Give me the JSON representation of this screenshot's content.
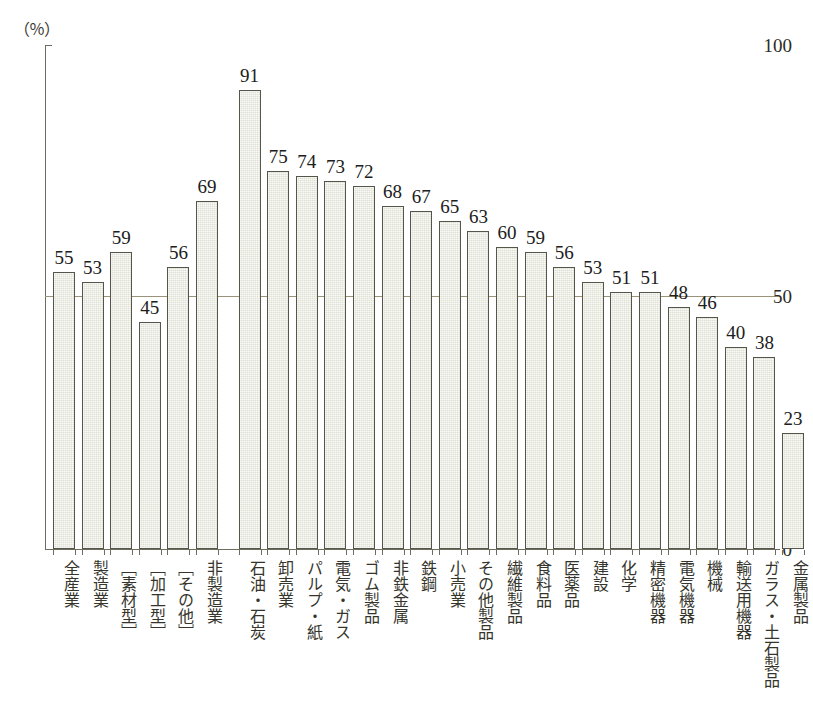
{
  "top_strip_text": "",
  "axis": {
    "y_unit": "（％）",
    "y_ticks": [
      "100",
      "50",
      "0"
    ]
  },
  "chart_data": {
    "type": "bar",
    "title": "",
    "xlabel": "",
    "ylabel": "（％）",
    "ylim": [
      0,
      100
    ],
    "grid": true,
    "gridlines": [
      50
    ],
    "legend": "none",
    "categories": [
      "全産業",
      "製造業",
      "［素材型］",
      "［加工型］",
      "［その他］",
      "非製造業",
      "石油・石炭",
      "卸売業",
      "パルプ・紙",
      "電気・ガス",
      "ゴム製品",
      "非鉄金属",
      "鉄鋼",
      "小売業",
      "その他製品",
      "繊維製品",
      "食料品",
      "医薬品",
      "建設",
      "化学",
      "精密機器",
      "電気機器",
      "機械",
      "輸送用機器",
      "ガラス・土石製品",
      "金属製品"
    ],
    "values": [
      55,
      53,
      59,
      45,
      56,
      69,
      91,
      75,
      74,
      73,
      72,
      68,
      67,
      65,
      63,
      60,
      59,
      56,
      53,
      51,
      51,
      48,
      46,
      40,
      38,
      23
    ]
  },
  "colors": {
    "bar_fill": "#dfe0d4",
    "bar_border": "#55554a",
    "axis": "#6d6d60",
    "gridline": "#9a9279",
    "text": "#2b2b25",
    "background": "#ffffff"
  }
}
